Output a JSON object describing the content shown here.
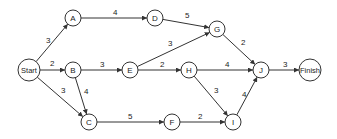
{
  "diagram": {
    "type": "network-graph",
    "nodes": [
      {
        "id": "Start",
        "label": "Start",
        "x": 29,
        "y": 70,
        "r": 11
      },
      {
        "id": "A",
        "label": "A",
        "x": 73,
        "y": 18,
        "r": 8
      },
      {
        "id": "B",
        "label": "B",
        "x": 73,
        "y": 70,
        "r": 8
      },
      {
        "id": "C",
        "label": "C",
        "x": 89,
        "y": 122,
        "r": 8
      },
      {
        "id": "D",
        "label": "D",
        "x": 155,
        "y": 18,
        "r": 8
      },
      {
        "id": "E",
        "label": "E",
        "x": 130,
        "y": 70,
        "r": 8
      },
      {
        "id": "F",
        "label": "F",
        "x": 172,
        "y": 122,
        "r": 8
      },
      {
        "id": "G",
        "label": "G",
        "x": 217,
        "y": 29,
        "r": 8
      },
      {
        "id": "H",
        "label": "H",
        "x": 189,
        "y": 70,
        "r": 8
      },
      {
        "id": "I",
        "label": "I",
        "x": 233,
        "y": 122,
        "r": 8
      },
      {
        "id": "J",
        "label": "J",
        "x": 261,
        "y": 70,
        "r": 8
      },
      {
        "id": "Finish",
        "label": "Finish",
        "x": 310,
        "y": 70,
        "r": 11
      }
    ],
    "edges": [
      {
        "from": "Start",
        "to": "A",
        "weight": "3",
        "lx": 46,
        "ly": 43
      },
      {
        "from": "Start",
        "to": "B",
        "weight": "2",
        "lx": 50,
        "ly": 66
      },
      {
        "from": "Start",
        "to": "C",
        "weight": "3",
        "lx": 61,
        "ly": 93
      },
      {
        "from": "A",
        "to": "D",
        "weight": "4",
        "lx": 113,
        "ly": 15
      },
      {
        "from": "B",
        "to": "E",
        "weight": "3",
        "lx": 100,
        "ly": 67
      },
      {
        "from": "B",
        "to": "C",
        "weight": "4",
        "lx": 84,
        "ly": 94
      },
      {
        "from": "C",
        "to": "F",
        "weight": "5",
        "lx": 128,
        "ly": 119
      },
      {
        "from": "D",
        "to": "G",
        "weight": "5",
        "lx": 185,
        "ly": 18
      },
      {
        "from": "E",
        "to": "G",
        "weight": "3",
        "lx": 168,
        "ly": 46
      },
      {
        "from": "E",
        "to": "H",
        "weight": "2",
        "lx": 160,
        "ly": 67
      },
      {
        "from": "F",
        "to": "I",
        "weight": "2",
        "lx": 198,
        "ly": 119
      },
      {
        "from": "G",
        "to": "J",
        "weight": "2",
        "lx": 241,
        "ly": 45
      },
      {
        "from": "H",
        "to": "J",
        "weight": "4",
        "lx": 225,
        "ly": 67
      },
      {
        "from": "H",
        "to": "I",
        "weight": "3",
        "lx": 214,
        "ly": 93
      },
      {
        "from": "I",
        "to": "J",
        "weight": "4",
        "lx": 242,
        "ly": 97
      },
      {
        "from": "J",
        "to": "Finish",
        "weight": "3",
        "lx": 283,
        "ly": 67
      }
    ]
  }
}
